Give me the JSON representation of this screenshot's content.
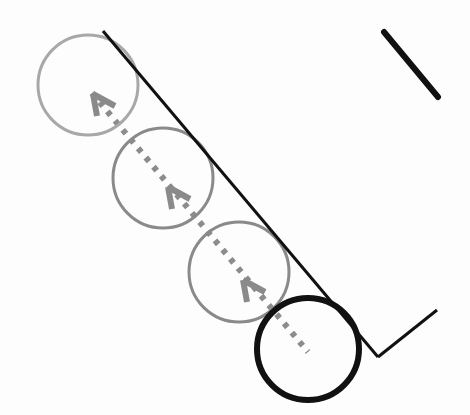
{
  "figure": {
    "colors": {
      "background": "#fdfdfd",
      "wall": "#111111",
      "ghost_circle_light": "#a8a8a8",
      "ghost_circle": "#8a8a8a",
      "final_circle": "#111111",
      "trajectory": "#8c8c8c",
      "arrowhead": "#8a8a8a"
    },
    "wall": {
      "main_segment": {
        "x1": 103,
        "y1": 31,
        "x2": 378,
        "y2": 357
      },
      "corner_segment": {
        "x1": 378,
        "y1": 357,
        "x2": 437,
        "y2": 310
      }
    },
    "separate_stroke": {
      "x1": 384,
      "y1": 32,
      "x2": 438,
      "y2": 97
    },
    "circles": [
      {
        "id": "ghost-1",
        "cx": 88,
        "cy": 85,
        "r": 50
      },
      {
        "id": "ghost-2",
        "cx": 163,
        "cy": 178,
        "r": 50
      },
      {
        "id": "ghost-3",
        "cx": 239,
        "cy": 272,
        "r": 50
      },
      {
        "id": "final",
        "cx": 308,
        "cy": 349,
        "r": 51
      }
    ],
    "trajectory": {
      "x1": 92,
      "y1": 93,
      "x2": 308,
      "y2": 352
    },
    "arrowheads": [
      {
        "x": 93,
        "y": 94
      },
      {
        "x": 168,
        "y": 187
      },
      {
        "x": 243,
        "y": 280
      }
    ]
  }
}
